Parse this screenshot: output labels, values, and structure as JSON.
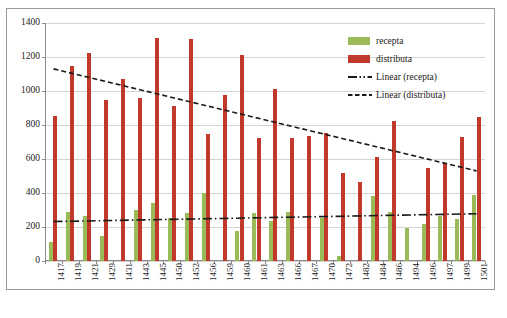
{
  "chart_data": {
    "type": "bar",
    "title": "",
    "xlabel": "",
    "ylabel": "",
    "ylim": [
      0,
      1400
    ],
    "ytick_step": 200,
    "yticks": [
      0,
      200,
      400,
      600,
      800,
      1000,
      1200,
      1400
    ],
    "grid": true,
    "legend_position": "top-right",
    "categories": [
      "1417",
      "1419",
      "1421",
      "1429",
      "1431",
      "1443",
      "1445",
      "1450",
      "1452",
      "1456",
      "1459",
      "1460",
      "1461",
      "1463",
      "1466",
      "1467",
      "1470",
      "1472",
      "1482",
      "1484",
      "1486",
      "1494",
      "1496",
      "1497",
      "1499",
      "1501"
    ],
    "series": [
      {
        "name": "recepta",
        "color": "#9BBB59",
        "values": [
          110,
          290,
          265,
          150,
          0,
          300,
          340,
          255,
          285,
          400,
          0,
          175,
          285,
          235,
          290,
          0,
          255,
          30,
          0,
          385,
          290,
          195,
          220,
          265,
          250,
          390
        ]
      },
      {
        "name": "distributa",
        "color": "#C0392B",
        "values": [
          855,
          1150,
          1225,
          950,
          1070,
          960,
          1310,
          910,
          1305,
          745,
          975,
          1210,
          725,
          1010,
          725,
          735,
          755,
          515,
          465,
          610,
          825,
          0,
          545,
          575,
          730,
          850
        ]
      }
    ],
    "trendlines": [
      {
        "name": "Linear (recepta)",
        "style": "dash-dot",
        "color": "#1a1a1a",
        "y_start": 232,
        "y_end": 278
      },
      {
        "name": "Linear (distributa)",
        "style": "dashed",
        "color": "#1a1a1a",
        "y_start": 1130,
        "y_end": 530
      }
    ],
    "legend": [
      {
        "label": "recepta",
        "marker": "swatch-green"
      },
      {
        "label": "distributa",
        "marker": "swatch-red"
      },
      {
        "label": "Linear (recepta)",
        "marker": "line-dash-dot"
      },
      {
        "label": "Linear (distributa)",
        "marker": "line-dashed"
      }
    ]
  }
}
